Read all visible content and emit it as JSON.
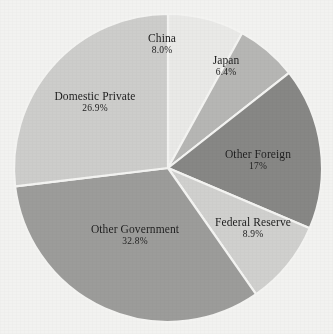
{
  "chart_data": {
    "type": "pie",
    "title": "",
    "subtitle": "",
    "xlabel": "",
    "ylabel": "",
    "legend_position": "none",
    "grid": false,
    "labels_on_slices": true,
    "start_angle_deg": 0,
    "direction": "clockwise",
    "categories": [
      "China",
      "Japan",
      "Other Foreign",
      "Federal Reserve",
      "Other Government",
      "Domestic Private"
    ],
    "values": [
      8.0,
      6.4,
      17.0,
      8.9,
      32.8,
      26.9
    ],
    "value_labels": [
      "8.0%",
      "6.4%",
      "17%",
      "8.9%",
      "32.8%",
      "26.9%"
    ],
    "colors": [
      "#e9e9e7",
      "#b6b6b4",
      "#878785",
      "#d0d0ce",
      "#9c9c9a",
      "#cdcdcb"
    ],
    "slice_separator_color": "#f4f4f2",
    "background_color": "#f2f2f0",
    "label_color": "#1b1b1b",
    "slices": [
      {
        "name": "China",
        "value": 8.0,
        "value_label": "8.0%",
        "color": "#e9e9e7"
      },
      {
        "name": "Japan",
        "value": 6.4,
        "value_label": "6.4%",
        "color": "#b6b6b4"
      },
      {
        "name": "Other Foreign",
        "value": 17.0,
        "value_label": "17%",
        "color": "#878785"
      },
      {
        "name": "Federal Reserve",
        "value": 8.9,
        "value_label": "8.9%",
        "color": "#d0d0ce"
      },
      {
        "name": "Other Government",
        "value": 32.8,
        "value_label": "32.8%",
        "color": "#9c9c9a"
      },
      {
        "name": "Domestic Private",
        "value": 26.9,
        "value_label": "26.9%",
        "color": "#cdcdcb"
      }
    ]
  },
  "label_positions": [
    {
      "left": 162,
      "top": 44,
      "anchor": "center"
    },
    {
      "left": 226,
      "top": 66,
      "anchor": "center"
    },
    {
      "left": 258,
      "top": 160,
      "anchor": "center"
    },
    {
      "left": 253,
      "top": 228,
      "anchor": "center"
    },
    {
      "left": 135,
      "top": 235,
      "anchor": "center"
    },
    {
      "left": 95,
      "top": 102,
      "anchor": "center"
    }
  ]
}
